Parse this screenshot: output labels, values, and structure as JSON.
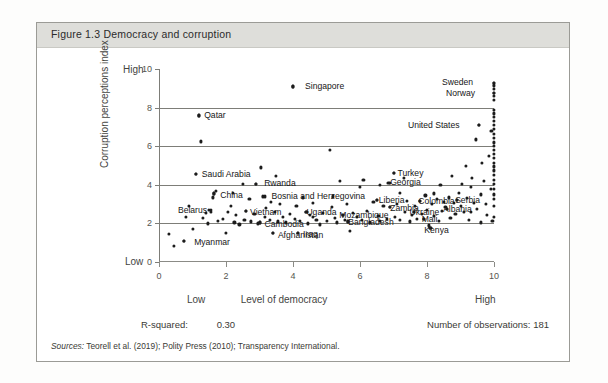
{
  "figure": {
    "number": "Figure 1.3",
    "title": "Figure 1.3   Democracy and corruption",
    "rsquared_label": "R-squared:",
    "rsquared_value": "0.30",
    "observations": "Number of observations: 181",
    "sources_prefix": "Sources:",
    "sources_text": " Teorell et al. (2019); Polity Press (2010); Transparency International."
  },
  "chart_data": {
    "type": "scatter",
    "title": "Democracy and corruption",
    "xlabel": "Level of democracy",
    "ylabel": "Corruption perceptions index",
    "xlim": [
      0,
      10
    ],
    "ylim": [
      0,
      10
    ],
    "xticks": [
      "0",
      "2",
      "4",
      "6",
      "8",
      "10"
    ],
    "yticks": [
      "0",
      "2",
      "4",
      "6",
      "8",
      "10"
    ],
    "x_axis_low_label": "Low",
    "x_axis_high_label": "High",
    "y_axis_low_label": "Low",
    "y_axis_high_label": "High",
    "grid": "horizontal gridlines at y = 2, 4, 6, 8",
    "gridlines_y": [
      2,
      4,
      6,
      8
    ],
    "legend": null,
    "n_observations": 181,
    "r_squared": 0.3,
    "marker_color": "#1c1c1c",
    "labeled_points": [
      {
        "label": "Singapore",
        "x": 4.0,
        "y": 9.1,
        "lx": 12,
        "ly": 0
      },
      {
        "label": "Sweden",
        "x": 10.0,
        "y": 9.3,
        "lx": -52,
        "ly": -1
      },
      {
        "label": "Norway",
        "x": 10.0,
        "y": 8.75,
        "lx": -48,
        "ly": 0
      },
      {
        "label": "United States",
        "x": 9.55,
        "y": 7.1,
        "lx": -71,
        "ly": 0
      },
      {
        "label": "Qatar",
        "x": 1.2,
        "y": 7.6,
        "lx": 5,
        "ly": 0
      },
      {
        "label": "Saudi Arabia",
        "x": 1.1,
        "y": 4.55,
        "lx": 6,
        "ly": 0
      },
      {
        "label": "China",
        "x": 1.65,
        "y": 3.55,
        "lx": 6,
        "ly": 2
      },
      {
        "label": "Belarus",
        "x": 1.55,
        "y": 2.7,
        "lx": -33,
        "ly": 0
      },
      {
        "label": "Vietnam",
        "x": 2.6,
        "y": 2.65,
        "lx": 4,
        "ly": 1
      },
      {
        "label": "Myanmar",
        "x": 0.75,
        "y": 1.1,
        "lx": 10,
        "ly": 1
      },
      {
        "label": "Afghanistan",
        "x": 3.4,
        "y": 1.5,
        "lx": 5,
        "ly": 2
      },
      {
        "label": "Rwanda",
        "x": 2.9,
        "y": 4.05,
        "lx": 8,
        "ly": -1
      },
      {
        "label": "Bosnia and Herzegovina",
        "x": 3.15,
        "y": 3.4,
        "lx": 7,
        "ly": 0
      },
      {
        "label": "Uganda",
        "x": 4.4,
        "y": 2.6,
        "lx": 0,
        "ly": 0
      },
      {
        "label": "Cambodia",
        "x": 3.0,
        "y": 2.05,
        "lx": 5,
        "ly": 2
      },
      {
        "label": "Iraq",
        "x": 4.15,
        "y": 1.5,
        "lx": 5,
        "ly": 1
      },
      {
        "label": "Bangladesh",
        "x": 5.65,
        "y": 2.1,
        "lx": 0,
        "ly": 1
      },
      {
        "label": "Mozambique",
        "x": 5.5,
        "y": 2.45,
        "lx": -4,
        "ly": 0
      },
      {
        "label": "Georgia",
        "x": 6.9,
        "y": 4.1,
        "lx": 0,
        "ly": -1
      },
      {
        "label": "Liberia",
        "x": 6.5,
        "y": 3.2,
        "lx": 2,
        "ly": 0
      },
      {
        "label": "Zambia",
        "x": 6.9,
        "y": 2.85,
        "lx": 0,
        "ly": 1
      },
      {
        "label": "Turkey",
        "x": 7.0,
        "y": 4.6,
        "lx": 4,
        "ly": 0
      },
      {
        "label": "Colombia",
        "x": 7.8,
        "y": 3.15,
        "lx": -2,
        "ly": 0
      },
      {
        "label": "Serbia",
        "x": 8.9,
        "y": 3.2,
        "lx": -2,
        "ly": 0
      },
      {
        "label": "Albania",
        "x": 8.6,
        "y": 2.75,
        "lx": -4,
        "ly": 0
      },
      {
        "label": "Ukraine",
        "x": 7.6,
        "y": 2.6,
        "lx": -4,
        "ly": 0
      },
      {
        "label": "Mali",
        "x": 7.9,
        "y": 2.25,
        "lx": -2,
        "ly": 0
      },
      {
        "label": "Kenya",
        "x": 8.1,
        "y": 1.75,
        "lx": -6,
        "ly": 2
      }
    ],
    "points": [
      [
        0.3,
        1.45
      ],
      [
        0.45,
        0.85
      ],
      [
        0.75,
        1.1
      ],
      [
        0.8,
        2.35
      ],
      [
        1.0,
        1.7
      ],
      [
        1.1,
        4.55
      ],
      [
        1.2,
        7.6
      ],
      [
        1.25,
        6.25
      ],
      [
        1.4,
        2.55
      ],
      [
        1.45,
        2.0
      ],
      [
        1.5,
        2.7
      ],
      [
        1.55,
        2.6
      ],
      [
        1.6,
        3.35
      ],
      [
        1.65,
        3.55
      ],
      [
        1.7,
        3.7
      ],
      [
        1.75,
        2.15
      ],
      [
        1.9,
        2.25
      ],
      [
        2.0,
        1.5
      ],
      [
        2.05,
        2.6
      ],
      [
        2.15,
        2.9
      ],
      [
        2.25,
        2.05
      ],
      [
        2.3,
        2.45
      ],
      [
        2.4,
        1.95
      ],
      [
        2.5,
        4.05
      ],
      [
        2.55,
        2.2
      ],
      [
        2.6,
        2.65
      ],
      [
        2.7,
        3.25
      ],
      [
        2.75,
        2.1
      ],
      [
        2.85,
        2.5
      ],
      [
        2.9,
        4.05
      ],
      [
        2.95,
        2.0
      ],
      [
        3.0,
        2.05
      ],
      [
        3.05,
        4.9
      ],
      [
        3.1,
        3.4
      ],
      [
        3.15,
        2.35
      ],
      [
        3.2,
        2.8
      ],
      [
        3.3,
        2.2
      ],
      [
        3.4,
        1.5
      ],
      [
        3.45,
        2.6
      ],
      [
        3.5,
        4.45
      ],
      [
        3.55,
        2.1
      ],
      [
        3.6,
        3.0
      ],
      [
        3.7,
        2.35
      ],
      [
        3.8,
        2.05
      ],
      [
        3.9,
        2.5
      ],
      [
        4.0,
        9.1
      ],
      [
        4.05,
        2.25
      ],
      [
        4.1,
        2.9
      ],
      [
        4.15,
        1.5
      ],
      [
        4.2,
        2.15
      ],
      [
        4.3,
        3.35
      ],
      [
        4.4,
        2.6
      ],
      [
        4.45,
        2.0
      ],
      [
        4.5,
        2.45
      ],
      [
        4.6,
        3.05
      ],
      [
        4.7,
        2.2
      ],
      [
        4.8,
        1.95
      ],
      [
        4.9,
        2.55
      ],
      [
        5.0,
        2.15
      ],
      [
        5.1,
        5.8
      ],
      [
        5.15,
        2.85
      ],
      [
        5.25,
        2.3
      ],
      [
        5.3,
        2.05
      ],
      [
        5.4,
        4.2
      ],
      [
        5.5,
        2.45
      ],
      [
        5.55,
        2.2
      ],
      [
        5.6,
        3.0
      ],
      [
        5.65,
        2.1
      ],
      [
        5.7,
        1.6
      ],
      [
        5.8,
        2.55
      ],
      [
        5.9,
        2.35
      ],
      [
        6.0,
        3.9
      ],
      [
        6.05,
        2.2
      ],
      [
        6.1,
        4.25
      ],
      [
        6.2,
        2.65
      ],
      [
        6.3,
        2.05
      ],
      [
        6.4,
        3.1
      ],
      [
        6.5,
        3.2
      ],
      [
        6.55,
        2.4
      ],
      [
        6.6,
        2.15
      ],
      [
        6.7,
        2.9
      ],
      [
        6.8,
        2.25
      ],
      [
        6.85,
        4.1
      ],
      [
        6.9,
        2.85
      ],
      [
        7.0,
        4.6
      ],
      [
        7.05,
        2.35
      ],
      [
        7.1,
        3.0
      ],
      [
        7.2,
        2.2
      ],
      [
        7.3,
        4.35
      ],
      [
        7.35,
        2.6
      ],
      [
        7.4,
        3.15
      ],
      [
        7.5,
        2.1
      ],
      [
        7.55,
        2.45
      ],
      [
        7.6,
        2.6
      ],
      [
        7.65,
        2.9
      ],
      [
        7.7,
        2.25
      ],
      [
        7.8,
        3.15
      ],
      [
        7.85,
        2.5
      ],
      [
        7.9,
        2.25
      ],
      [
        7.95,
        3.45
      ],
      [
        8.0,
        2.7
      ],
      [
        8.05,
        1.9
      ],
      [
        8.1,
        1.75
      ],
      [
        8.15,
        3.0
      ],
      [
        8.2,
        2.4
      ],
      [
        8.3,
        3.25
      ],
      [
        8.35,
        2.15
      ],
      [
        8.4,
        4.0
      ],
      [
        8.45,
        2.65
      ],
      [
        8.5,
        3.1
      ],
      [
        8.55,
        2.85
      ],
      [
        8.6,
        2.75
      ],
      [
        8.65,
        3.35
      ],
      [
        8.7,
        2.3
      ],
      [
        8.75,
        4.45
      ],
      [
        8.8,
        3.05
      ],
      [
        8.85,
        2.5
      ],
      [
        8.9,
        3.2
      ],
      [
        8.95,
        3.6
      ],
      [
        9.0,
        2.9
      ],
      [
        9.05,
        4.05
      ],
      [
        9.1,
        2.6
      ],
      [
        9.15,
        5.0
      ],
      [
        9.2,
        3.3
      ],
      [
        9.25,
        2.2
      ],
      [
        9.3,
        3.9
      ],
      [
        9.35,
        4.35
      ],
      [
        9.4,
        3.05
      ],
      [
        9.45,
        6.35
      ],
      [
        9.5,
        2.75
      ],
      [
        9.55,
        7.1
      ],
      [
        9.6,
        3.5
      ],
      [
        9.65,
        5.15
      ],
      [
        9.7,
        4.2
      ],
      [
        9.75,
        3.0
      ],
      [
        9.8,
        2.45
      ],
      [
        9.85,
        5.5
      ],
      [
        9.9,
        3.8
      ],
      [
        9.92,
        6.8
      ],
      [
        9.95,
        2.15
      ],
      [
        10.0,
        9.3
      ],
      [
        10.0,
        9.15
      ],
      [
        10.0,
        8.95
      ],
      [
        10.0,
        8.75
      ],
      [
        10.0,
        8.6
      ],
      [
        10.0,
        8.4
      ],
      [
        10.0,
        7.9
      ],
      [
        10.0,
        7.7
      ],
      [
        10.0,
        7.5
      ],
      [
        10.0,
        7.3
      ],
      [
        10.0,
        7.1
      ],
      [
        10.0,
        6.9
      ],
      [
        10.0,
        6.65
      ],
      [
        10.0,
        6.45
      ],
      [
        10.0,
        6.2
      ],
      [
        10.0,
        6.0
      ],
      [
        10.0,
        5.8
      ],
      [
        10.0,
        5.6
      ],
      [
        10.0,
        5.4
      ],
      [
        10.0,
        5.15
      ],
      [
        10.0,
        4.95
      ],
      [
        10.0,
        4.75
      ],
      [
        10.0,
        4.5
      ],
      [
        10.0,
        4.25
      ],
      [
        10.0,
        4.05
      ],
      [
        10.0,
        3.8
      ],
      [
        10.0,
        3.5
      ],
      [
        10.0,
        3.25
      ],
      [
        10.0,
        2.9
      ],
      [
        10.0,
        2.35
      ],
      [
        9.6,
        2.05
      ],
      [
        9.3,
        2.6
      ],
      [
        8.2,
        3.55
      ],
      [
        7.2,
        3.6
      ],
      [
        6.6,
        4.0
      ],
      [
        5.2,
        3.4
      ],
      [
        4.6,
        2.35
      ],
      [
        3.35,
        3.1
      ],
      [
        2.2,
        3.6
      ],
      [
        1.3,
        2.3
      ],
      [
        0.9,
        2.9
      ]
    ]
  }
}
